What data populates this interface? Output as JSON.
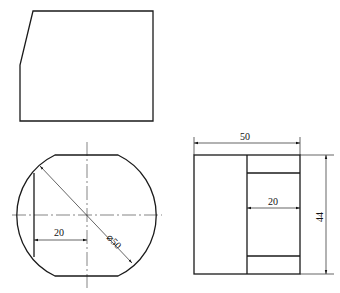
{
  "drawing": {
    "top_view": {
      "outline": [
        [
          33,
          11
        ],
        [
          153,
          11
        ],
        [
          153,
          121
        ],
        [
          20,
          121
        ],
        [
          20,
          65
        ]
      ]
    },
    "front_view": {
      "center": [
        87,
        215
      ],
      "radius": 67,
      "flat_top_y": 155,
      "flat_bottom_y": 276,
      "chord_x": 34,
      "dim_width_label": "20",
      "dim_diameter_label": "⌀50"
    },
    "side_view": {
      "rect": {
        "x": 194,
        "y": 155,
        "w": 106,
        "h": 119
      },
      "inner_vertical_x": 247,
      "inner_top_y": 173,
      "inner_bottom_y": 256,
      "dim_width_label": "50",
      "dim_inner_label": "20",
      "dim_height_label": "44"
    }
  }
}
